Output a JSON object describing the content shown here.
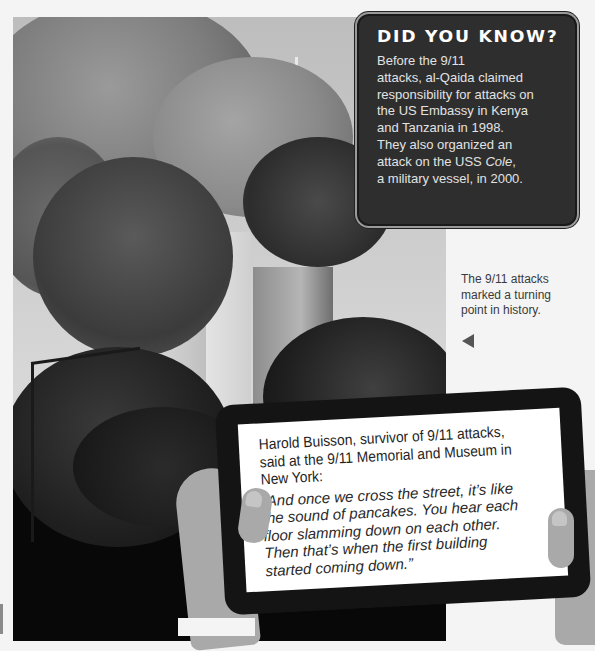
{
  "did_you_know": {
    "title": "DID YOU KNOW?",
    "lines": [
      "Before the 9/11",
      "attacks, al-Qaida claimed",
      "responsibility for attacks on",
      "the US Embassy in Kenya",
      "and Tanzania in 1998.",
      "They also organized an"
    ],
    "line7_pre": "attack on the USS ",
    "line7_italic": "Cole",
    "line7_post": ",",
    "line8": "a military vessel, in 2000."
  },
  "photo": {
    "subject": "twin-towers-smoke-photo"
  },
  "caption": {
    "lines": [
      "The 9/11 attacks",
      "marked a turning",
      "point in history."
    ],
    "pointer_icon": "left-triangle-icon"
  },
  "tablet": {
    "speaker_lines": [
      "Harold Buisson, survivor of 9/11 attacks,",
      "said at the 9/11 Memorial and Museum in",
      "New York:"
    ],
    "quote_lines": [
      "“And once we cross the street, it’s like",
      "the sound of pancakes. You hear each",
      "floor slamming down on each other.",
      "Then that’s when the first building",
      "started coming down.”"
    ]
  },
  "colors": {
    "box_bg": "#2e2e2e",
    "box_text": "#e2e2e2",
    "tablet_frame": "#141414",
    "hand": "#a9a9a9",
    "page_bg": "#f4f4f4"
  }
}
